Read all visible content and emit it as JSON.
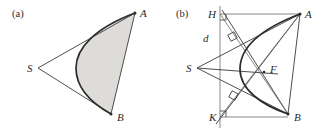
{
  "figure": {
    "width": 331,
    "height": 133,
    "background": "#ffffff",
    "stroke_color": "#3a3a3a",
    "shade_color": "#dedcd8"
  },
  "panels": [
    {
      "id": "a",
      "label": "(a)",
      "label_x": 12,
      "label_y": 9,
      "points": [
        {
          "name": "S",
          "label": "S",
          "x": 38,
          "y": 68,
          "label_x": 27,
          "label_y": 63
        },
        {
          "name": "A",
          "label": "A",
          "x": 135,
          "y": 13,
          "label_x": 140,
          "label_y": 8
        },
        {
          "name": "B",
          "label": "B",
          "x": 111,
          "y": 114,
          "label_x": 117,
          "label_y": 112
        }
      ],
      "shaded_region": true
    },
    {
      "id": "b",
      "label": "(b)",
      "label_x": 176,
      "label_y": 9,
      "points": [
        {
          "name": "S",
          "label": "S",
          "x": 197,
          "y": 68,
          "label_x": 186,
          "label_y": 63
        },
        {
          "name": "A",
          "label": "A",
          "x": 300,
          "y": 14,
          "label_x": 305,
          "label_y": 9
        },
        {
          "name": "B",
          "label": "B",
          "x": 288,
          "y": 114,
          "label_x": 294,
          "label_y": 112
        },
        {
          "name": "H",
          "label": "H",
          "x": 220,
          "y": 14,
          "label_x": 208,
          "label_y": 9
        },
        {
          "name": "K",
          "label": "K",
          "x": 220,
          "y": 117,
          "label_x": 209,
          "label_y": 112
        },
        {
          "name": "F",
          "label": "F",
          "x": 265,
          "y": 70,
          "label_x": 270,
          "label_y": 64
        }
      ],
      "directrix_label": "d",
      "directrix_label_x": 203,
      "directrix_label_y": 33,
      "shaded_region": false
    }
  ],
  "caption": {
    "alt": "Two geometry diagrams: (a) a parabolic segment shaded inside triangle S A B; (b) the same construction with directrix d, points H and K on the directrix, focus F, and right-angle markers."
  }
}
